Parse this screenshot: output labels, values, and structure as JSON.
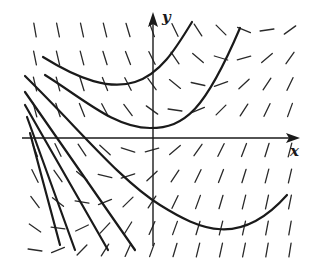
{
  "diagram": {
    "type": "slope-field",
    "axes": {
      "x_label": "x",
      "y_label": "y"
    },
    "colors": {
      "ink": "#1a1a1a",
      "background": "#ffffff"
    },
    "origin_px": [
      153,
      138
    ],
    "solution_curves": [
      {
        "name": "upper-parabola",
        "path": "M43,57 C80,80 110,90 135,82 S175,50 192,22"
      },
      {
        "name": "middle-parabola",
        "path": "M45,75 C85,100 115,128 150,128 S205,110 240,28"
      },
      {
        "name": "lower-parabola",
        "path": "M25,76 C80,130 120,180 160,205 S240,248 287,195"
      },
      {
        "name": "straight-line-1",
        "path": "M25,92 L135,250"
      },
      {
        "name": "straight-line-2",
        "path": "M25,105 L108,250"
      },
      {
        "name": "straight-line-3",
        "path": "M27,117 L75,250"
      },
      {
        "name": "straight-line-4",
        "path": "M30,133 L60,245"
      }
    ],
    "grid": {
      "cols": [
        35,
        58,
        82,
        105,
        128,
        152,
        175,
        198,
        221,
        244,
        267,
        290
      ],
      "rows": [
        30,
        58,
        84,
        110,
        150,
        176,
        202,
        228,
        250
      ]
    }
  }
}
